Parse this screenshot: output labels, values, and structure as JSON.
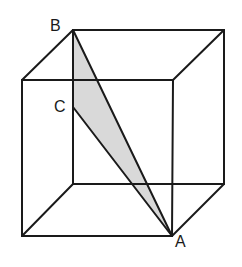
{
  "diagram": {
    "type": "cube-with-shaded-triangle",
    "colors": {
      "edge": "#1a1a1a",
      "shade": "#d9d9d9",
      "background": "#ffffff"
    },
    "labels": [
      {
        "id": "B",
        "text": "B",
        "x": 50,
        "y": 18
      },
      {
        "id": "C",
        "text": "C",
        "x": 54,
        "y": 99
      },
      {
        "id": "A",
        "text": "A",
        "x": 175,
        "y": 234
      }
    ],
    "points": {
      "B": [
        73,
        30
      ],
      "C": [
        73,
        107
      ],
      "A": [
        172,
        236
      ]
    }
  }
}
